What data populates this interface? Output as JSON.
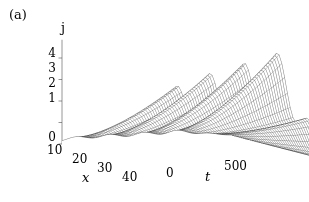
{
  "figure": {
    "panel_label": "(a)",
    "background_color": "#ffffff",
    "line_color": "#3c3c3c",
    "axis_color": "#505050"
  },
  "chart_data": {
    "type": "line",
    "render": "surface-mesh-3d",
    "title": "",
    "subtitle": "",
    "panel": "(a)",
    "xlabel": "x",
    "ylabel": "t",
    "zlabel": "j",
    "xlim": [
      0,
      45
    ],
    "ylim": [
      0,
      620
    ],
    "zlim": [
      0,
      5
    ],
    "xticks": [
      10,
      20,
      30,
      40
    ],
    "xtick_labels": [
      "10",
      "20",
      "30",
      "40"
    ],
    "yticks": [
      0,
      500
    ],
    "ytick_labels": [
      "0",
      "500"
    ],
    "zticks": [
      0,
      1,
      2,
      3,
      4
    ],
    "ztick_labels": [
      "0",
      "1",
      "2",
      "3",
      "4"
    ],
    "grid": false,
    "legend": false,
    "legend_position": "none",
    "mesh": {
      "nx": 46,
      "nt": 62,
      "x_min": 0,
      "x_max": 45,
      "t_min": 0,
      "t_max": 620
    },
    "peaks": [
      {
        "index": 1,
        "t": 55,
        "amplitude": 3.7
      },
      {
        "index": 2,
        "t": 175,
        "amplitude": 4.2
      },
      {
        "index": 3,
        "t": 300,
        "amplitude": 4.6
      },
      {
        "index": 4,
        "t": 420,
        "amplitude": 5.0
      },
      {
        "index": 5,
        "t": 540,
        "amplitude": 2.6
      }
    ],
    "surface_model": {
      "wave_period_t": 122,
      "front_baseline": 0.35,
      "back_amplitude_factor": 1.0,
      "x_ramp_exponent": 1.35,
      "t_decay_start": 470,
      "t_decay_length": 150
    },
    "projection": {
      "type": "oblique",
      "origin_px": [
        62,
        144
      ],
      "x_axis_vector_px": [
        100,
        30
      ],
      "t_axis_vector_px": [
        170,
        -8
      ],
      "z_unit_px": 21.5
    }
  },
  "axes": {
    "j": {
      "label": "j",
      "ticks": [
        {
          "value": "4",
          "top": 47
        },
        {
          "value": "3",
          "top": 62
        },
        {
          "value": "2",
          "top": 77
        },
        {
          "value": "1",
          "top": 92
        },
        {
          "value": "0",
          "top": 131
        }
      ]
    },
    "x": {
      "label": "x",
      "ticks": [
        {
          "value": "10",
          "left": 47,
          "top": 144
        },
        {
          "value": "20",
          "left": 72,
          "top": 153
        },
        {
          "value": "30",
          "left": 97,
          "top": 162
        },
        {
          "value": "40",
          "left": 122,
          "top": 171
        }
      ]
    },
    "t": {
      "label": "t",
      "ticks": [
        {
          "value": "0",
          "left": 166,
          "top": 167
        },
        {
          "value": "500",
          "left": 224,
          "top": 160
        }
      ]
    }
  }
}
